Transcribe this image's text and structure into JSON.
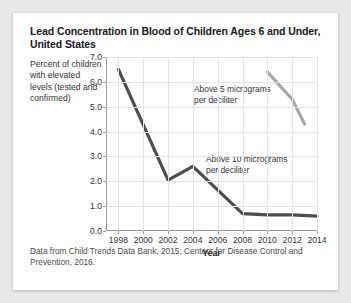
{
  "card": {
    "title": "Lead Concentration in Blood of Children Ages 6 and Under, United States",
    "y_axis_caption": "Percent of children with elevated levels (tested and confirmed)",
    "source": "Data from Child Trends Data Bank, 2015; Centers for Disease Control and Prevention, 2016."
  },
  "chart_data": {
    "type": "line",
    "title": "Lead Concentration in Blood of Children Ages 6 and Under, United States",
    "xlabel": "Year",
    "ylabel": "Percent of children with elevated levels (tested and confirmed)",
    "xlim": [
      1997,
      2014
    ],
    "ylim": [
      0.0,
      7.0
    ],
    "ytick_labels": [
      "0.0",
      "1.0",
      "2.0",
      "3.0",
      "4.0",
      "5.0",
      "6.0",
      "7.0"
    ],
    "ytick_values": [
      0.0,
      1.0,
      2.0,
      3.0,
      4.0,
      5.0,
      6.0,
      7.0
    ],
    "xtick_labels": [
      "1998",
      "2000",
      "2002",
      "2004",
      "2006",
      "2008",
      "2010",
      "2012",
      "2014"
    ],
    "xtick_values": [
      1998,
      2000,
      2002,
      2004,
      2006,
      2008,
      2010,
      2012,
      2014
    ],
    "grid": true,
    "legend_position": "inline-annotations",
    "series": [
      {
        "name": "Above 10 micrograms per deciliter",
        "color": "#4d4d4d",
        "x": [
          1998,
          2002,
          2004,
          2008,
          2010,
          2012,
          2014
        ],
        "values": [
          6.5,
          2.05,
          2.6,
          0.7,
          0.65,
          0.65,
          0.6
        ]
      },
      {
        "name": "Above 5 micrograms per deciliter",
        "color": "#a8a8a8",
        "x": [
          2010,
          2012,
          2013
        ],
        "values": [
          6.4,
          5.3,
          4.3
        ]
      }
    ],
    "annotations": [
      {
        "text": "Above 5 micrograms\nper deciliter",
        "series": "Above 5 micrograms per deciliter"
      },
      {
        "text": "Above 10 micrograms\nper deciliter",
        "series": "Above 10 micrograms per deciliter"
      }
    ]
  }
}
